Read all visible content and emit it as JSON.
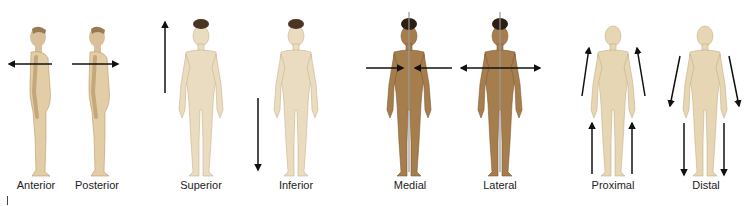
{
  "panels": [
    {
      "label": "Anterior",
      "view": "side",
      "arrow": "left-horizontal",
      "x": 42,
      "skin": "#e2cda6"
    },
    {
      "label": "Posterior",
      "view": "side",
      "arrow": "right-horizontal",
      "x": 97,
      "skin": "#e2cda6"
    },
    {
      "label": "Superior",
      "view": "front-male",
      "arrow": "up-left",
      "x": 201,
      "skin": "#eadcc0"
    },
    {
      "label": "Inferior",
      "view": "front-male",
      "arrow": "down-left",
      "x": 295,
      "skin": "#eadcc0"
    },
    {
      "label": "Medial",
      "view": "front-female-dark",
      "arrow": "inward-midline",
      "x": 410,
      "skin": "#a67e4e"
    },
    {
      "label": "Lateral",
      "view": "front-female-dark",
      "arrow": "outward-midline",
      "x": 500,
      "skin": "#a67e4e"
    },
    {
      "label": "Proximal",
      "view": "front-female-light",
      "arrow": "limbs-up",
      "x": 613,
      "skin": "#e6d6b4"
    },
    {
      "label": "Distal",
      "view": "front-female-light",
      "arrow": "limbs-down",
      "x": 705,
      "skin": "#e6d6b4"
    }
  ],
  "colors": {
    "arrow": "#111111",
    "midline": "#999999",
    "text": "#222222"
  }
}
